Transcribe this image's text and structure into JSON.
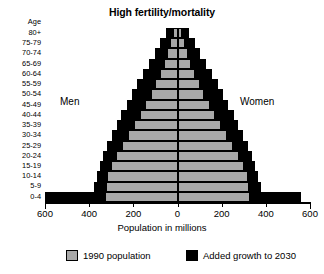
{
  "chart_data": {
    "type": "bar",
    "subtype": "population-pyramid",
    "title": "High fertility/mortality",
    "xlabel": "Population in millions",
    "ylabel": "Age",
    "xlim": [
      -600,
      600
    ],
    "xticks": [
      -600,
      -400,
      -200,
      0,
      200,
      400,
      600
    ],
    "xticklabels": [
      "600",
      "400",
      "200",
      "0",
      "200",
      "400",
      "600"
    ],
    "grid": false,
    "legend_position": "bottom",
    "side_labels": {
      "left": "Men",
      "right": "Women"
    },
    "categories": [
      "80+",
      "75-79",
      "70-74",
      "65-69",
      "60-64",
      "55-59",
      "50-54",
      "45-49",
      "40-44",
      "35-39",
      "30-34",
      "25-29",
      "20-24",
      "15-19",
      "10-14",
      "5-9",
      "0-4"
    ],
    "series": [
      {
        "name": "1990 population",
        "color": "#a8a8a8",
        "men": [
          22,
          32,
          46,
          62,
          80,
          100,
          122,
          146,
          170,
          196,
          222,
          250,
          278,
          300,
          318,
          326,
          330
        ],
        "women": [
          22,
          32,
          46,
          62,
          80,
          100,
          122,
          146,
          170,
          196,
          222,
          250,
          278,
          300,
          318,
          326,
          330
        ]
      },
      {
        "name": "Added growth to 2030",
        "color": "#000000",
        "men": [
          52,
          78,
          104,
          130,
          156,
          182,
          206,
          230,
          254,
          276,
          298,
          318,
          336,
          352,
          366,
          380,
          600
        ],
        "women": [
          52,
          78,
          104,
          130,
          156,
          182,
          206,
          230,
          254,
          276,
          298,
          318,
          336,
          352,
          366,
          380,
          560
        ]
      }
    ]
  },
  "legend": {
    "items": [
      {
        "label": "1990 population",
        "swatch": "gray"
      },
      {
        "label": "Added growth to 2030",
        "swatch": "black"
      }
    ]
  },
  "age_axis": {
    "header": "Age",
    "labels": [
      "80+",
      "75-79",
      "70-74",
      "65-69",
      "60-64",
      "55-59",
      "50-54",
      "45-49",
      "40-44",
      "35-39",
      "30-34",
      "25-29",
      "20-24",
      "15-19",
      "10-14",
      "5-9",
      "0-4"
    ]
  }
}
